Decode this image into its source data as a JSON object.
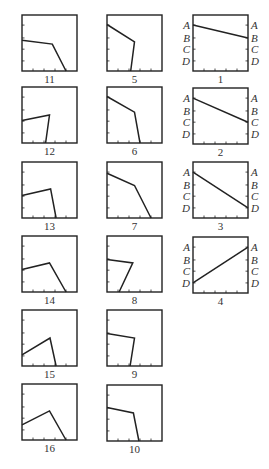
{
  "figure": {
    "width": 269,
    "height": 469,
    "stroke_color": "#222222",
    "box_size": {
      "w": 55,
      "h": 56
    },
    "axis_letters": [
      "A",
      "B",
      "C",
      "D"
    ],
    "letter_levels": [
      0.18,
      0.41,
      0.61,
      0.82
    ],
    "bottom_ticks": [
      0.2,
      0.4,
      0.6,
      0.8
    ],
    "left_ticks": [
      0.18,
      0.41,
      0.61,
      0.82
    ]
  },
  "panels": [
    {
      "label": "11",
      "x": 22,
      "y": 15,
      "type": "polyline",
      "points": [
        [
          0,
          0.45
        ],
        [
          0.55,
          0.52
        ],
        [
          0.8,
          1.0
        ]
      ]
    },
    {
      "label": "5",
      "x": 107,
      "y": 15,
      "type": "polyline",
      "points": [
        [
          0,
          0.17
        ],
        [
          0.5,
          0.48
        ],
        [
          0.43,
          1.0
        ]
      ]
    },
    {
      "label": "1",
      "x": 193,
      "y": 15,
      "type": "line",
      "from": "A",
      "to": "B"
    },
    {
      "label": "12",
      "x": 22,
      "y": 87,
      "type": "polyline",
      "points": [
        [
          0,
          0.6
        ],
        [
          0.5,
          0.5
        ],
        [
          0.43,
          1.0
        ]
      ]
    },
    {
      "label": "6",
      "x": 107,
      "y": 87,
      "type": "polyline",
      "points": [
        [
          0,
          0.17
        ],
        [
          0.5,
          0.45
        ],
        [
          0.6,
          1.0
        ]
      ]
    },
    {
      "label": "2",
      "x": 193,
      "y": 88,
      "type": "line",
      "from": "A",
      "to": "C"
    },
    {
      "label": "13",
      "x": 22,
      "y": 162,
      "type": "polyline",
      "points": [
        [
          0,
          0.6
        ],
        [
          0.52,
          0.48
        ],
        [
          0.62,
          1.0
        ]
      ]
    },
    {
      "label": "7",
      "x": 107,
      "y": 162,
      "type": "polyline",
      "points": [
        [
          0,
          0.2
        ],
        [
          0.5,
          0.42
        ],
        [
          0.8,
          1.0
        ]
      ]
    },
    {
      "label": "3",
      "x": 193,
      "y": 162,
      "type": "line",
      "from": "A",
      "to": "D"
    },
    {
      "label": "14",
      "x": 22,
      "y": 236,
      "type": "polyline",
      "points": [
        [
          0,
          0.6
        ],
        [
          0.5,
          0.48
        ],
        [
          0.8,
          1.0
        ]
      ]
    },
    {
      "label": "8",
      "x": 107,
      "y": 236,
      "type": "polyline",
      "points": [
        [
          0,
          0.42
        ],
        [
          0.47,
          0.48
        ],
        [
          0.22,
          1.0
        ]
      ]
    },
    {
      "label": "4",
      "x": 193,
      "y": 237,
      "type": "line",
      "from": "D",
      "to": "A"
    },
    {
      "label": "15",
      "x": 22,
      "y": 310,
      "type": "polyline",
      "points": [
        [
          0,
          0.8
        ],
        [
          0.51,
          0.5
        ],
        [
          0.62,
          1.0
        ]
      ]
    },
    {
      "label": "9",
      "x": 107,
      "y": 310,
      "type": "polyline",
      "points": [
        [
          0,
          0.42
        ],
        [
          0.5,
          0.5
        ],
        [
          0.42,
          1.0
        ]
      ]
    },
    {
      "label": "16",
      "x": 22,
      "y": 384,
      "type": "polyline",
      "points": [
        [
          0,
          0.73
        ],
        [
          0.5,
          0.48
        ],
        [
          0.8,
          1.0
        ]
      ]
    },
    {
      "label": "10",
      "x": 107,
      "y": 385,
      "type": "polyline",
      "points": [
        [
          0,
          0.4
        ],
        [
          0.48,
          0.5
        ],
        [
          0.58,
          1.0
        ]
      ]
    }
  ]
}
